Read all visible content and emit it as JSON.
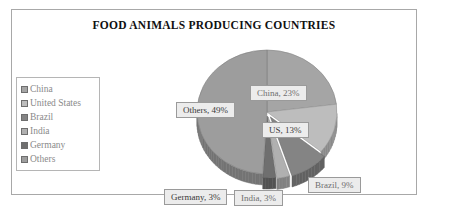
{
  "chart_data": {
    "type": "pie",
    "title": "FOOD ANIMALS PRODUCING COUNTRIES",
    "categories": [
      "China",
      "United States",
      "Brazil",
      "India",
      "Germany",
      "Others"
    ],
    "values": [
      23,
      13,
      9,
      3,
      3,
      49
    ],
    "unit": "%",
    "legend_position": "left",
    "grid": false,
    "style": "3d-exploded-pie",
    "slice_colors": [
      "#a5a5a5",
      "#bdbdbd",
      "#848484",
      "#b0b0b0",
      "#6f6f6f",
      "#9d9d9d"
    ],
    "data_labels": [
      {
        "name": "china-data-label",
        "text": "China, 23%"
      },
      {
        "name": "us-data-label",
        "text": "US, 13%"
      },
      {
        "name": "brazil-data-label",
        "text": "Brazil, 9%"
      },
      {
        "name": "india-data-label",
        "text": "India, 3%"
      },
      {
        "name": "germany-data-label",
        "text": "Germany, 3%"
      },
      {
        "name": "others-data-label",
        "text": "Others, 49%"
      }
    ]
  },
  "legend": {
    "items": [
      {
        "label": "China",
        "color": "#a5a5a5"
      },
      {
        "label": "United States",
        "color": "#bdbdbd"
      },
      {
        "label": "Brazil",
        "color": "#848484"
      },
      {
        "label": "India",
        "color": "#b0b0b0"
      },
      {
        "label": "Germany",
        "color": "#6f6f6f"
      },
      {
        "label": "Others",
        "color": "#9d9d9d"
      }
    ]
  },
  "colors": {
    "frame_border": "#a8a8a8",
    "background": "#ffffff",
    "label_fill": "#ececec",
    "label_border": "#9a9a9a",
    "title_color": "#101010"
  }
}
